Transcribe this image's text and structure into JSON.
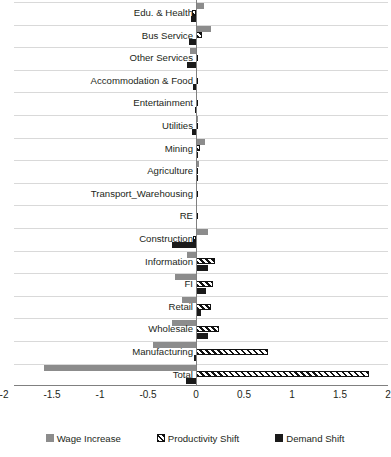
{
  "chart_data": {
    "type": "bar",
    "orientation": "horizontal",
    "title": "",
    "xlabel": "",
    "ylabel": "",
    "xlim": [
      -2,
      2
    ],
    "xticks": [
      -2,
      -1.5,
      -1,
      -0.5,
      0,
      0.5,
      1,
      1.5,
      2
    ],
    "xtick_labels": [
      "-2",
      "-1.5",
      "-1",
      "-0.5",
      "0",
      "0.5",
      "1",
      "1.5",
      "2"
    ],
    "grid": true,
    "legend_position": "bottom",
    "categories": [
      "Edu. & Health",
      "Bus Service",
      "Other Services",
      "Accommodation & Food",
      "Entertainment",
      "Utilities",
      "Mining",
      "Agriculture",
      "Transport_Warehousing",
      "RE",
      "Construction",
      "Information",
      "FI",
      "Retail",
      "Wholesale",
      "Manufacturing",
      "Total"
    ],
    "series": [
      {
        "name": "Wage Increase",
        "color": "#8c8c8c",
        "values": [
          0.08,
          0.16,
          -0.06,
          0.0,
          0.0,
          0.02,
          0.09,
          0.03,
          0.0,
          0.0,
          0.13,
          -0.09,
          -0.22,
          -0.15,
          -0.25,
          -0.45,
          -1.58
        ]
      },
      {
        "name": "Productivity Shift",
        "color": "#ffffff",
        "hatch": "diagonal",
        "values": [
          -0.04,
          0.06,
          0.0,
          0.0,
          0.0,
          0.0,
          0.04,
          0.02,
          0.02,
          0.01,
          -0.03,
          0.2,
          0.18,
          0.16,
          0.24,
          0.75,
          1.8
        ]
      },
      {
        "name": "Demand Shift",
        "color": "#1a1a1a",
        "values": [
          -0.05,
          -0.07,
          -0.09,
          -0.03,
          -0.01,
          -0.04,
          0.02,
          0.02,
          0.01,
          0.01,
          -0.25,
          0.12,
          0.1,
          0.05,
          0.13,
          -0.02,
          -0.1
        ]
      }
    ]
  },
  "legend": {
    "items": [
      {
        "label": "Wage Increase",
        "swatch": "gray-square-icon"
      },
      {
        "label": "Productivity Shift",
        "swatch": "hatched-square-icon"
      },
      {
        "label": "Demand Shift",
        "swatch": "black-square-icon"
      }
    ]
  }
}
